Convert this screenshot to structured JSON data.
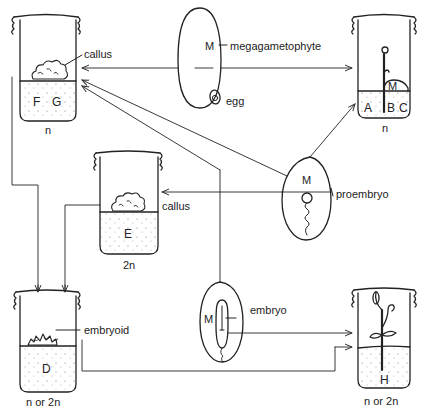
{
  "diagram": {
    "type": "plant tissue culture pathways (haploid/diploid regeneration from ovules)",
    "vessels": [
      {
        "id": "FG",
        "contents": [
          "F",
          "G"
        ],
        "ploidy": "n",
        "annotation": "callus"
      },
      {
        "id": "ABC",
        "contents": [
          "A",
          "B",
          "C"
        ],
        "ploidy": "n",
        "annotation": "M"
      },
      {
        "id": "E",
        "contents": [
          "E"
        ],
        "ploidy": "2n",
        "annotation": "callus"
      },
      {
        "id": "D",
        "contents": [
          "D"
        ],
        "ploidy": "n or 2n",
        "annotation": "embryoid"
      },
      {
        "id": "H",
        "contents": [
          "H"
        ],
        "ploidy": "n or 2n",
        "annotation": ""
      }
    ],
    "ovules": [
      {
        "id": "top",
        "labels": [
          "M",
          "megagametophyte",
          "egg"
        ]
      },
      {
        "id": "middle",
        "labels": [
          "M",
          "proembryo"
        ]
      },
      {
        "id": "bottom",
        "labels": [
          "M",
          "embryo"
        ]
      }
    ]
  },
  "labels": {
    "callus_top": "callus",
    "fg_f": "F",
    "fg_g": "G",
    "fg_ploidy": "n",
    "top_m": "M",
    "megagametophyte": "megagametophyte",
    "egg": "egg",
    "abc_a": "A",
    "abc_b": "B",
    "abc_c": "C",
    "abc_m": "M",
    "abc_ploidy": "n",
    "mid_m": "M",
    "proembryo": "proembryo",
    "callus_mid": "callus",
    "e_label": "E",
    "e_ploidy": "2n",
    "embryoid": "embryoid",
    "d_label": "D",
    "d_ploidy": "n or 2n",
    "bot_m": "M",
    "embryo": "embryo",
    "h_label": "H",
    "h_ploidy": "n or 2n"
  }
}
